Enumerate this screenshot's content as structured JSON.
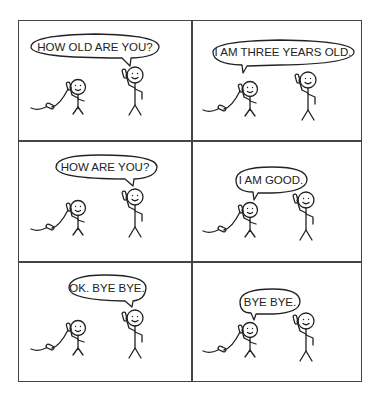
{
  "comic": {
    "panels": [
      {
        "speech": "HOW OLD ARE YOU?",
        "speaker": "right"
      },
      {
        "speech": "I AM THREE YEARS OLD.",
        "speaker": "left"
      },
      {
        "speech": "HOW ARE YOU?",
        "speaker": "right"
      },
      {
        "speech": "I AM GOOD.",
        "speaker": "left"
      },
      {
        "speech": "OK. BYE BYE.",
        "speaker": "right"
      },
      {
        "speech": "BYE BYE.",
        "speaker": "left"
      }
    ]
  },
  "colors": {
    "ink": "#222222",
    "background": "#ffffff",
    "border": "#444444"
  }
}
